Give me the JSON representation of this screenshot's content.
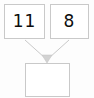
{
  "diagram": {
    "type": "arithmetic-combine-diagram",
    "background_color": "#fdfdfd",
    "box_border_color": "#c9c9c9",
    "box_fill_color": "#ffffff",
    "connector_color": "#c9c9c9",
    "text_color": "#0d0d0d",
    "nodes": {
      "operand_left": {
        "label": "11",
        "empty": false
      },
      "operand_right": {
        "label": "8",
        "empty": false
      },
      "result": {
        "label": "",
        "empty": true
      }
    },
    "connectors": [
      {
        "id": "left-to-result",
        "from": "operand_left",
        "to": "result",
        "has_arrowhead": true
      },
      {
        "id": "right-to-result",
        "from": "operand_right",
        "to": "result",
        "has_arrowhead": true
      }
    ]
  }
}
